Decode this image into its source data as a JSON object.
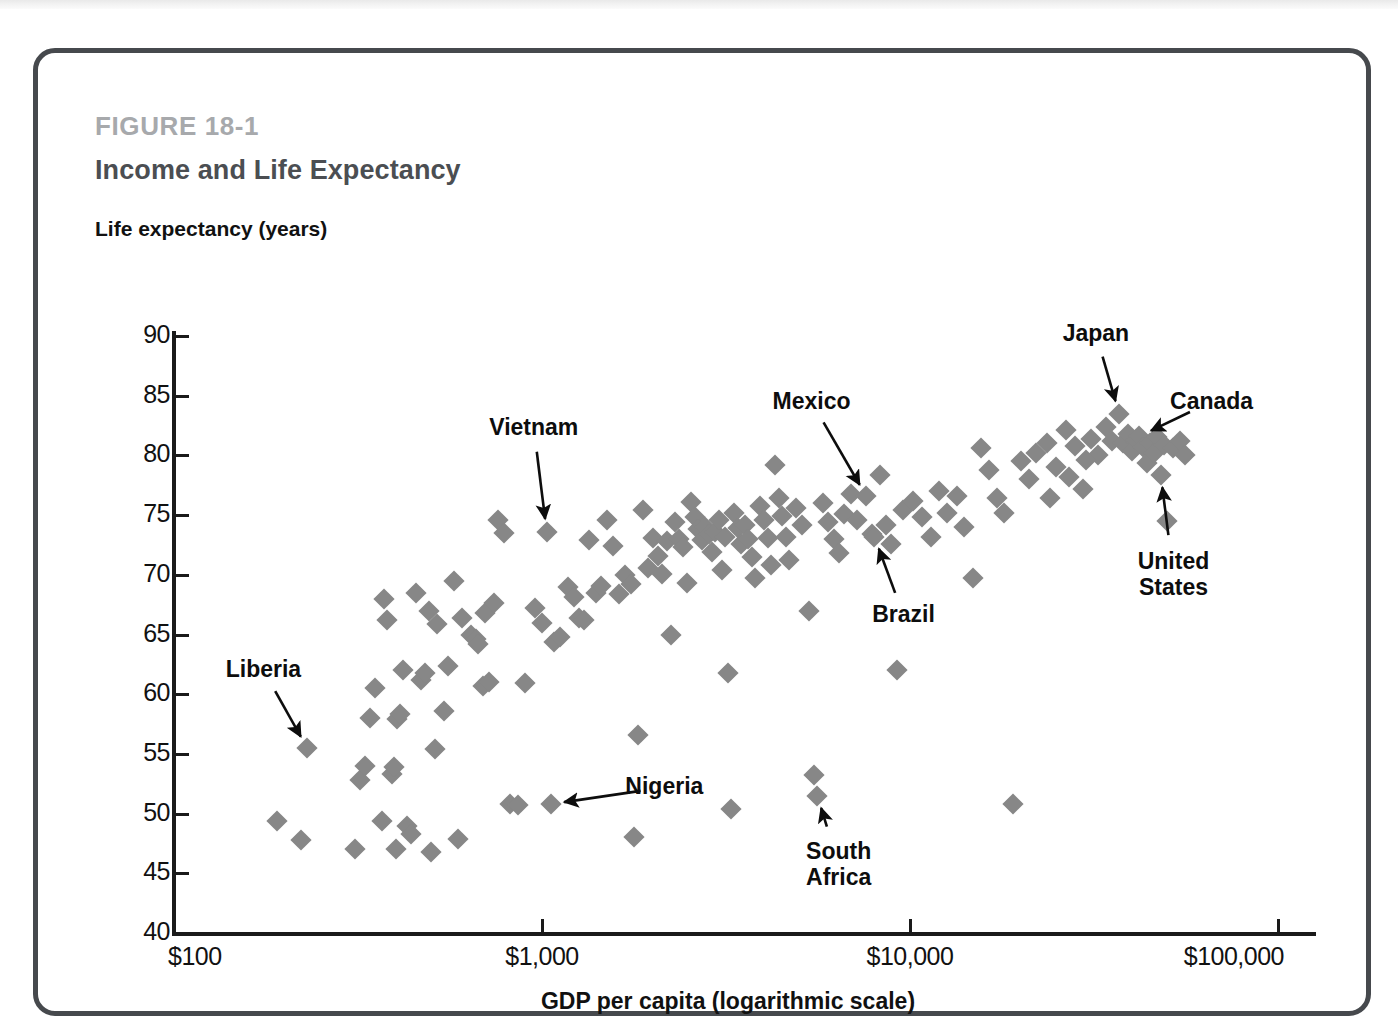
{
  "figure": {
    "number": "FIGURE 18-1",
    "title": "Income and Life Expectancy"
  },
  "chart_data": {
    "type": "scatter",
    "title": "Income and Life Expectancy",
    "xlabel": "GDP per capita (logarithmic scale)",
    "ylabel": "Life expectancy (years)",
    "x_scale": "log",
    "xlim": [
      100,
      100000
    ],
    "ylim": [
      40,
      90
    ],
    "x_ticks": [
      100,
      1000,
      10000,
      100000
    ],
    "x_tick_labels": [
      "$100",
      "$1,000",
      "$10,000",
      "$100,000"
    ],
    "y_ticks": [
      40,
      45,
      50,
      55,
      60,
      65,
      70,
      75,
      80,
      85,
      90
    ],
    "y_tick_labels": [
      "40",
      "45",
      "50",
      "55",
      "60",
      "65",
      "70",
      "75",
      "80",
      "85",
      "90"
    ],
    "grid": false,
    "legend": null,
    "marker": "diamond",
    "marker_color": "#878787",
    "annotations": [
      {
        "label": "Liberia",
        "x": 230,
        "y": 55.5,
        "label_x": 175,
        "label_y": 62.0,
        "lines": [
          "Liberia"
        ]
      },
      {
        "label": "Vietnam",
        "x": 1030,
        "y": 73.6,
        "label_x": 950,
        "label_y": 82.3,
        "lines": [
          "Vietnam"
        ]
      },
      {
        "label": "Nigeria",
        "x": 1060,
        "y": 50.8,
        "label_x": 2150,
        "label_y": 52.2,
        "lines": [
          "Nigeria"
        ]
      },
      {
        "label": "Mexico",
        "x": 7600,
        "y": 76.6,
        "label_x": 5400,
        "label_y": 84.5,
        "lines": [
          "Mexico"
        ]
      },
      {
        "label": "Brazil",
        "x": 8000,
        "y": 73.2,
        "label_x": 9600,
        "label_y": 66.6,
        "lines": [
          "Brazil"
        ]
      },
      {
        "label": "South Africa",
        "x": 5600,
        "y": 51.5,
        "label_x": 6400,
        "label_y": 45.7,
        "lines": [
          "South",
          "Africa"
        ]
      },
      {
        "label": "Japan",
        "x": 37000,
        "y": 83.5,
        "label_x": 32000,
        "label_y": 90.2,
        "lines": [
          "Japan"
        ]
      },
      {
        "label": "Canada",
        "x": 42000,
        "y": 81.6,
        "label_x": 66000,
        "label_y": 84.5,
        "lines": [
          "Canada"
        ]
      },
      {
        "label": "United States",
        "x": 48000,
        "y": 78.4,
        "label_x": 52000,
        "label_y": 70.0,
        "lines": [
          "United",
          "States"
        ]
      }
    ],
    "points": [
      [
        190,
        49.4
      ],
      [
        222,
        47.8
      ],
      [
        230,
        55.5
      ],
      [
        310,
        47.0
      ],
      [
        320,
        52.8
      ],
      [
        330,
        54.0
      ],
      [
        340,
        58.0
      ],
      [
        352,
        60.5
      ],
      [
        368,
        49.4
      ],
      [
        372,
        68.0
      ],
      [
        378,
        66.2
      ],
      [
        390,
        53.3
      ],
      [
        396,
        53.9
      ],
      [
        400,
        47.0
      ],
      [
        404,
        57.9
      ],
      [
        412,
        58.3
      ],
      [
        420,
        62.0
      ],
      [
        430,
        49.0
      ],
      [
        440,
        48.3
      ],
      [
        455,
        68.5
      ],
      [
        470,
        61.2
      ],
      [
        480,
        61.8
      ],
      [
        492,
        67.0
      ],
      [
        500,
        46.8
      ],
      [
        512,
        55.4
      ],
      [
        520,
        65.9
      ],
      [
        540,
        58.6
      ],
      [
        556,
        62.4
      ],
      [
        578,
        69.5
      ],
      [
        590,
        47.9
      ],
      [
        608,
        66.4
      ],
      [
        640,
        65.0
      ],
      [
        660,
        64.6
      ],
      [
        672,
        64.2
      ],
      [
        690,
        60.7
      ],
      [
        700,
        66.8
      ],
      [
        720,
        61.0
      ],
      [
        740,
        67.6
      ],
      [
        760,
        74.6
      ],
      [
        790,
        73.5
      ],
      [
        820,
        50.8
      ],
      [
        860,
        50.7
      ],
      [
        900,
        60.9
      ],
      [
        960,
        67.2
      ],
      [
        1000,
        66.0
      ],
      [
        1030,
        73.6
      ],
      [
        1060,
        50.8
      ],
      [
        1080,
        64.4
      ],
      [
        1120,
        64.8
      ],
      [
        1180,
        69.0
      ],
      [
        1220,
        68.1
      ],
      [
        1260,
        66.4
      ],
      [
        1300,
        66.2
      ],
      [
        1340,
        72.9
      ],
      [
        1400,
        68.5
      ],
      [
        1450,
        69.1
      ],
      [
        1500,
        74.6
      ],
      [
        1560,
        72.4
      ],
      [
        1620,
        68.4
      ],
      [
        1680,
        70.0
      ],
      [
        1740,
        69.2
      ],
      [
        1780,
        48.0
      ],
      [
        1820,
        56.6
      ],
      [
        1880,
        75.4
      ],
      [
        1940,
        70.6
      ],
      [
        2000,
        73.1
      ],
      [
        2060,
        71.6
      ],
      [
        2120,
        70.1
      ],
      [
        2180,
        72.8
      ],
      [
        2240,
        65.0
      ],
      [
        2300,
        74.4
      ],
      [
        2360,
        73.0
      ],
      [
        2420,
        72.3
      ],
      [
        2480,
        69.3
      ],
      [
        2540,
        76.1
      ],
      [
        2600,
        74.8
      ],
      [
        2660,
        73.8
      ],
      [
        2720,
        72.9
      ],
      [
        2780,
        74.0
      ],
      [
        2840,
        73.4
      ],
      [
        2900,
        71.9
      ],
      [
        2960,
        73.6
      ],
      [
        3020,
        74.6
      ],
      [
        3080,
        70.4
      ],
      [
        3140,
        73.2
      ],
      [
        3200,
        61.8
      ],
      [
        3260,
        50.4
      ],
      [
        3320,
        75.2
      ],
      [
        3400,
        73.9
      ],
      [
        3480,
        72.6
      ],
      [
        3560,
        74.2
      ],
      [
        3640,
        73.0
      ],
      [
        3720,
        71.5
      ],
      [
        3800,
        69.7
      ],
      [
        3900,
        75.8
      ],
      [
        4000,
        74.6
      ],
      [
        4100,
        73.1
      ],
      [
        4200,
        70.8
      ],
      [
        4300,
        79.2
      ],
      [
        4400,
        76.4
      ],
      [
        4500,
        74.9
      ],
      [
        4600,
        73.2
      ],
      [
        4700,
        71.2
      ],
      [
        4900,
        75.6
      ],
      [
        5100,
        74.2
      ],
      [
        5300,
        67.0
      ],
      [
        5500,
        53.2
      ],
      [
        5600,
        51.5
      ],
      [
        5800,
        76.0
      ],
      [
        6000,
        74.4
      ],
      [
        6200,
        73.0
      ],
      [
        6400,
        71.8
      ],
      [
        6600,
        75.1
      ],
      [
        6900,
        76.8
      ],
      [
        7200,
        74.6
      ],
      [
        7600,
        76.6
      ],
      [
        7900,
        73.4
      ],
      [
        8000,
        73.2
      ],
      [
        8300,
        78.4
      ],
      [
        8600,
        74.2
      ],
      [
        8900,
        72.6
      ],
      [
        9200,
        62.0
      ],
      [
        9600,
        75.4
      ],
      [
        10200,
        76.2
      ],
      [
        10800,
        74.8
      ],
      [
        11400,
        73.2
      ],
      [
        12000,
        77.0
      ],
      [
        12600,
        75.2
      ],
      [
        13400,
        76.6
      ],
      [
        14000,
        74.0
      ],
      [
        14800,
        69.7
      ],
      [
        15600,
        80.6
      ],
      [
        16400,
        78.8
      ],
      [
        17200,
        76.4
      ],
      [
        18000,
        75.2
      ],
      [
        19000,
        50.8
      ],
      [
        20000,
        79.5
      ],
      [
        21000,
        78.0
      ],
      [
        22000,
        80.2
      ],
      [
        23500,
        81.0
      ],
      [
        25000,
        79.0
      ],
      [
        26500,
        82.1
      ],
      [
        28000,
        80.8
      ],
      [
        29500,
        77.2
      ],
      [
        31000,
        81.4
      ],
      [
        32500,
        80.0
      ],
      [
        34000,
        82.4
      ],
      [
        35500,
        81.2
      ],
      [
        37000,
        83.5
      ],
      [
        38000,
        81.0
      ],
      [
        39000,
        81.8
      ],
      [
        40000,
        80.4
      ],
      [
        41000,
        81.3
      ],
      [
        42000,
        81.6
      ],
      [
        43000,
        80.7
      ],
      [
        44000,
        79.4
      ],
      [
        45000,
        81.0
      ],
      [
        46000,
        80.2
      ],
      [
        47000,
        81.5
      ],
      [
        48000,
        78.4
      ],
      [
        49000,
        80.9
      ],
      [
        50000,
        74.5
      ],
      [
        52000,
        80.6
      ],
      [
        54000,
        81.2
      ],
      [
        56000,
        80.0
      ],
      [
        27000,
        78.2
      ],
      [
        24000,
        76.4
      ],
      [
        30000,
        79.6
      ]
    ]
  }
}
